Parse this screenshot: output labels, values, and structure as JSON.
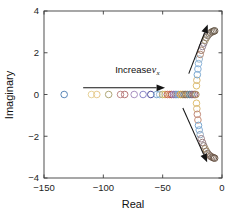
{
  "figure": {
    "title": "",
    "background": "#ffffff"
  },
  "axes": {
    "xlabel": "Real",
    "ylabel": "Imaginary",
    "xlim": [
      -150,
      0
    ],
    "ylim": [
      -4,
      4
    ],
    "xticks": [
      -150,
      -100,
      -50,
      0
    ],
    "xticklabels": [
      "−150",
      "−100",
      "−50",
      "0"
    ],
    "yticks": [
      -4,
      -2,
      0,
      2,
      4
    ],
    "yticklabels": [
      "−4",
      "−2",
      "0",
      "2",
      "4"
    ],
    "grid": false,
    "box": true,
    "axis_color": "#3d3d3d"
  },
  "annotations": [
    {
      "name": "increase-vx-label",
      "text_main": "Increase ",
      "text_var": "v",
      "text_sub": "x",
      "x": -90,
      "y": 1.05
    }
  ],
  "arrows": [
    {
      "name": "horizontal-arrow",
      "x1": -117,
      "y1": 0.32,
      "x2": -48,
      "y2": 0.32,
      "direction": "right"
    },
    {
      "name": "upper-arrow",
      "x1": -28,
      "y1": 1.0,
      "x2": -12,
      "y2": 3.35,
      "direction": "up-right"
    },
    {
      "name": "lower-arrow",
      "x1": -33,
      "y1": -0.65,
      "x2": -12.5,
      "y2": -3.25,
      "direction": "down-right"
    }
  ],
  "chart_data": {
    "type": "scatter",
    "title": "",
    "xlabel": "Real",
    "ylabel": "Imaginary",
    "xlim": [
      -150,
      0
    ],
    "ylim": [
      -4,
      4
    ],
    "xticks": [
      -150,
      -100,
      -50,
      0
    ],
    "yticks": [
      -4,
      -2,
      0,
      2,
      4
    ],
    "grid": false,
    "legend": null,
    "marker": "o",
    "marker_size": 4.6,
    "series": [
      {
        "name": "real-axis-branch",
        "color_cycle": true,
        "points": [
          {
            "x": -133.0,
            "y": 0.0,
            "color": "#5b87b8"
          },
          {
            "x": -110.0,
            "y": 0.0,
            "color": "#e8d39a"
          },
          {
            "x": -105.5,
            "y": 0.0,
            "color": "#e8c98f"
          },
          {
            "x": -95.5,
            "y": 0.0,
            "color": "#b0a878"
          },
          {
            "x": -85.5,
            "y": 0.0,
            "color": "#c08a8a"
          },
          {
            "x": -82.0,
            "y": 0.0,
            "color": "#b87878"
          },
          {
            "x": -74.0,
            "y": 0.0,
            "color": "#a890c0"
          },
          {
            "x": -66.5,
            "y": 0.0,
            "color": "#8a86c8"
          },
          {
            "x": -60.0,
            "y": 0.0,
            "color": "#4a4a9a"
          },
          {
            "x": -55.0,
            "y": 0.0,
            "color": "#7ba8cf"
          },
          {
            "x": -52.5,
            "y": 0.0,
            "color": "#8db5d8"
          },
          {
            "x": -50.0,
            "y": 0.0,
            "color": "#c0b070"
          },
          {
            "x": -48.0,
            "y": 0.0,
            "color": "#d8b85a"
          },
          {
            "x": -46.0,
            "y": 0.0,
            "color": "#c96a5a"
          },
          {
            "x": -44.0,
            "y": 0.0,
            "color": "#d87a60"
          },
          {
            "x": -42.5,
            "y": 0.0,
            "color": "#b05848"
          },
          {
            "x": -41.0,
            "y": 0.0,
            "color": "#9a7ab0"
          },
          {
            "x": -39.5,
            "y": 0.0,
            "color": "#8f6fa8"
          },
          {
            "x": -38.0,
            "y": 0.0,
            "color": "#7a9ac0"
          },
          {
            "x": -36.5,
            "y": 0.0,
            "color": "#6f9fc8"
          },
          {
            "x": -35.0,
            "y": 0.0,
            "color": "#d0a84a"
          },
          {
            "x": -33.5,
            "y": 0.0,
            "color": "#c89a40"
          },
          {
            "x": -32.0,
            "y": 0.0,
            "color": "#8a7a6a"
          },
          {
            "x": -30.5,
            "y": 0.0,
            "color": "#7a6a5a"
          },
          {
            "x": -29.0,
            "y": 0.0,
            "color": "#a07858"
          },
          {
            "x": -27.5,
            "y": 0.0,
            "color": "#6a8a9a"
          },
          {
            "x": -26.0,
            "y": 0.0,
            "color": "#5a7a8a"
          },
          {
            "x": -24.5,
            "y": 0.0,
            "color": "#9a6a7a"
          },
          {
            "x": -23.0,
            "y": 0.0,
            "color": "#8a5a6a"
          },
          {
            "x": -22.0,
            "y": 0.0,
            "color": "#b09060"
          }
        ]
      },
      {
        "name": "upper-complex-branch",
        "points": [
          {
            "x": -21.5,
            "y": 0.42,
            "color": "#e0c070"
          },
          {
            "x": -21.2,
            "y": 0.68,
            "color": "#d8b878"
          },
          {
            "x": -20.8,
            "y": 0.95,
            "color": "#7aa8d0"
          },
          {
            "x": -20.3,
            "y": 1.22,
            "color": "#88b0d8"
          },
          {
            "x": -19.8,
            "y": 1.48,
            "color": "#90b8dd"
          },
          {
            "x": -19.2,
            "y": 1.7,
            "color": "#9ab8d0"
          },
          {
            "x": -18.4,
            "y": 1.92,
            "color": "#b08a78"
          },
          {
            "x": -17.5,
            "y": 2.12,
            "color": "#a07a68"
          },
          {
            "x": -16.5,
            "y": 2.3,
            "color": "#9a8a98"
          },
          {
            "x": -15.4,
            "y": 2.46,
            "color": "#8a7a88"
          },
          {
            "x": -14.3,
            "y": 2.6,
            "color": "#a09070"
          },
          {
            "x": -13.2,
            "y": 2.72,
            "color": "#988868"
          },
          {
            "x": -12.0,
            "y": 2.82,
            "color": "#8a8078"
          },
          {
            "x": -10.8,
            "y": 2.9,
            "color": "#807870"
          },
          {
            "x": -9.6,
            "y": 2.96,
            "color": "#8a7a6a"
          },
          {
            "x": -8.4,
            "y": 3.0,
            "color": "#7a6a5a"
          },
          {
            "x": -7.2,
            "y": 3.03,
            "color": "#6f6050"
          },
          {
            "x": -6.2,
            "y": 3.05,
            "color": "#655848"
          }
        ]
      },
      {
        "name": "lower-complex-branch",
        "points": [
          {
            "x": -21.5,
            "y": -0.42,
            "color": "#e0c070"
          },
          {
            "x": -21.2,
            "y": -0.68,
            "color": "#d8b878"
          },
          {
            "x": -20.8,
            "y": -0.95,
            "color": "#c08878"
          },
          {
            "x": -20.3,
            "y": -1.22,
            "color": "#c8907a"
          },
          {
            "x": -19.8,
            "y": -1.48,
            "color": "#7aa8d0"
          },
          {
            "x": -19.2,
            "y": -1.7,
            "color": "#88b0d8"
          },
          {
            "x": -18.4,
            "y": -1.92,
            "color": "#90a8c0"
          },
          {
            "x": -17.5,
            "y": -2.12,
            "color": "#a08890"
          },
          {
            "x": -16.5,
            "y": -2.3,
            "color": "#9a8080"
          },
          {
            "x": -15.4,
            "y": -2.46,
            "color": "#8a7878"
          },
          {
            "x": -14.3,
            "y": -2.6,
            "color": "#a08868"
          },
          {
            "x": -13.2,
            "y": -2.72,
            "color": "#988060"
          },
          {
            "x": -12.0,
            "y": -2.82,
            "color": "#8a7a70"
          },
          {
            "x": -10.8,
            "y": -2.9,
            "color": "#807068"
          },
          {
            "x": -9.6,
            "y": -2.96,
            "color": "#8a7060"
          },
          {
            "x": -8.4,
            "y": -3.0,
            "color": "#7a6458"
          },
          {
            "x": -7.2,
            "y": -3.03,
            "color": "#6f5a4c"
          },
          {
            "x": -6.2,
            "y": -3.05,
            "color": "#6a5648"
          }
        ]
      }
    ]
  }
}
